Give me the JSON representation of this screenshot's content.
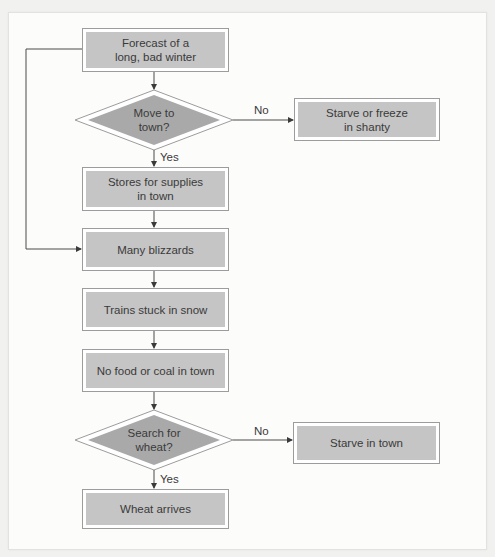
{
  "diagram": {
    "type": "flowchart",
    "nodes": {
      "forecast": {
        "label_line1": "Forecast of a",
        "label_line2": "long, bad winter",
        "shape": "process"
      },
      "move_to_town": {
        "label_line1": "Move to",
        "label_line2": "town?",
        "shape": "decision"
      },
      "starve_or_freeze": {
        "label_line1": "Starve or freeze",
        "label_line2": "in shanty",
        "shape": "process"
      },
      "stores": {
        "label_line1": "Stores for supplies",
        "label_line2": "in town",
        "shape": "process"
      },
      "blizzards": {
        "label": "Many blizzards",
        "shape": "process"
      },
      "trains": {
        "label": "Trains stuck in snow",
        "shape": "process"
      },
      "no_food": {
        "label": "No food or coal in town",
        "shape": "process"
      },
      "search_wheat": {
        "label_line1": "Search for",
        "label_line2": "wheat?",
        "shape": "decision"
      },
      "starve_in_town": {
        "label": "Starve in town",
        "shape": "process"
      },
      "wheat_arrives": {
        "label": "Wheat arrives",
        "shape": "process"
      }
    },
    "edge_labels": {
      "move_no": "No",
      "move_yes": "Yes",
      "search_no": "No",
      "search_yes": "Yes"
    },
    "edges": [
      {
        "from": "forecast",
        "to": "move_to_town"
      },
      {
        "from": "move_to_town",
        "to": "starve_or_freeze",
        "label": "No"
      },
      {
        "from": "move_to_town",
        "to": "stores",
        "label": "Yes"
      },
      {
        "from": "forecast",
        "to": "blizzards",
        "route": "left-loop"
      },
      {
        "from": "stores",
        "to": "blizzards"
      },
      {
        "from": "blizzards",
        "to": "trains"
      },
      {
        "from": "trains",
        "to": "no_food"
      },
      {
        "from": "no_food",
        "to": "search_wheat"
      },
      {
        "from": "search_wheat",
        "to": "starve_in_town",
        "label": "No"
      },
      {
        "from": "search_wheat",
        "to": "wheat_arrives",
        "label": "Yes"
      }
    ],
    "colors": {
      "box_fill": "#c5c5c5",
      "diamond_fill": "#a9a9a9",
      "outline": "#9c9c9c",
      "line": "#4a4a4a",
      "text": "#3a3a3a"
    }
  }
}
